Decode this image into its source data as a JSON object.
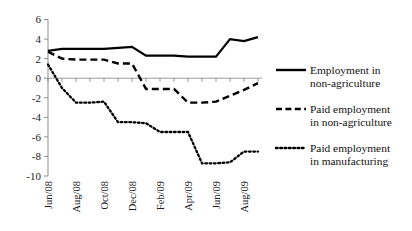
{
  "chart_data": {
    "type": "line",
    "title": "",
    "xlabel": "",
    "ylabel": "",
    "ylim": [
      -10,
      6
    ],
    "ytick_values": [
      6,
      4,
      2,
      0,
      -2,
      -4,
      -6,
      -8,
      -10
    ],
    "ytick_labels": [
      "6",
      "4",
      "2",
      "0",
      "-2",
      "-4",
      "-6",
      "-8",
      "-10"
    ],
    "grid": false,
    "legend_position": "right",
    "x": [
      "Jun/08",
      "Jul/08",
      "Aug/08",
      "Sep/08",
      "Oct/08",
      "Nov/08",
      "Dec/08",
      "Jan/09",
      "Feb/09",
      "Mar/09",
      "Apr/09",
      "May/09",
      "Jun/09",
      "Jul/09",
      "Aug/09",
      "Sep/09"
    ],
    "xtick_labels": [
      "Jun/08",
      "Aug/08",
      "Oct/08",
      "Dec/08",
      "Feb/09",
      "Apr/09",
      "Jun/09",
      "Aug/09"
    ],
    "xtick_indices": [
      0,
      2,
      4,
      6,
      8,
      10,
      12,
      14
    ],
    "series": [
      {
        "name": "Employment in non-agriculture",
        "style": "solid",
        "color": "#000000",
        "values": [
          2.8,
          3.0,
          3.0,
          3.0,
          3.0,
          3.1,
          3.2,
          2.3,
          2.3,
          2.3,
          2.2,
          2.2,
          2.2,
          4.0,
          3.8,
          4.2
        ]
      },
      {
        "name": "Paid employment in non-agriculture",
        "style": "dashed",
        "color": "#000000",
        "values": [
          2.7,
          2.0,
          1.9,
          1.9,
          1.9,
          1.5,
          1.5,
          -1.1,
          -1.1,
          -1.1,
          -2.5,
          -2.5,
          -2.4,
          -1.8,
          -1.2,
          -0.5
        ]
      },
      {
        "name": "Paid employment in manufacturing",
        "style": "dotted",
        "color": "#000000",
        "values": [
          1.4,
          -1.0,
          -2.5,
          -2.5,
          -2.4,
          -4.5,
          -4.5,
          -4.6,
          -5.5,
          -5.5,
          -5.5,
          -8.7,
          -8.7,
          -8.6,
          -7.5,
          -7.5
        ]
      }
    ]
  },
  "legend": {
    "items": [
      {
        "label_line1": "Employment in",
        "label_line2": "non-agriculture",
        "swatch": "solid-line-swatch"
      },
      {
        "label_line1": "Paid employment",
        "label_line2": "in non-agriculture",
        "swatch": "dashed-line-swatch"
      },
      {
        "label_line1": "Paid employment",
        "label_line2": "in manufacturing",
        "swatch": "dotted-line-swatch"
      }
    ]
  }
}
